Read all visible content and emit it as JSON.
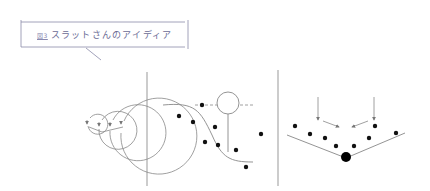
{
  "figure": {
    "number_label": "図3",
    "title": "スラットさんのアイディア",
    "accent_color": "#6b6b95",
    "line_color": "#8a8a8a",
    "panels": [
      {
        "name": "spiral-panel",
        "description": "concentric spiral with arrows converging to a point"
      },
      {
        "name": "sigmoid-panel",
        "description": "S-curve with scattered dots and balloon marker above dashed line"
      },
      {
        "name": "valley-panel",
        "description": "V-shaped valley with dots and converging arrows toward a large dot at the bottom"
      }
    ]
  }
}
